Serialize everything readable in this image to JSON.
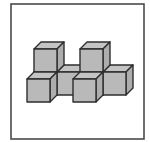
{
  "figure": {
    "frame": {
      "x": 11,
      "y": 4,
      "width": 133,
      "height": 135,
      "stroke": "#4a4a4a"
    },
    "colors": {
      "front": "#b9b9b9",
      "top": "#c4c4c4",
      "side": "#adadad",
      "edge": "#2e2e2e",
      "background": "#ffffff"
    },
    "cube_size": 23,
    "depth_offset": [
      7,
      -7
    ],
    "cubes": [
      {
        "name": "back-bottom-col0",
        "x": 34,
        "y": 72
      },
      {
        "name": "back-bottom-col1",
        "x": 57,
        "y": 72
      },
      {
        "name": "back-bottom-col2",
        "x": 80,
        "y": 72
      },
      {
        "name": "back-bottom-col3",
        "x": 103,
        "y": 72
      },
      {
        "name": "back-top-col0",
        "x": 34,
        "y": 49
      },
      {
        "name": "back-top-col2",
        "x": 80,
        "y": 49
      },
      {
        "name": "front-bottom-col0",
        "x": 27,
        "y": 79
      },
      {
        "name": "front-bottom-col2",
        "x": 73,
        "y": 79
      }
    ]
  }
}
